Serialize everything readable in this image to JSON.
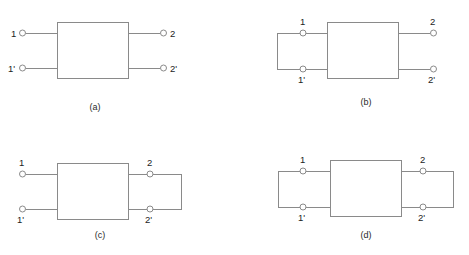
{
  "figure": {
    "type": "two-port-network-terminations",
    "panels": [
      {
        "id": "a",
        "caption": "(a)",
        "left_label_top": "1",
        "left_label_bottom": "1'",
        "right_label_top": "2",
        "right_label_bottom": "2'",
        "left_termination": "open",
        "right_termination": "open",
        "label_placement": "inline"
      },
      {
        "id": "b",
        "caption": "(b)",
        "left_label_top": "1",
        "left_label_bottom": "1'",
        "right_label_top": "2",
        "right_label_bottom": "2'",
        "left_termination": "short",
        "right_termination": "open",
        "label_placement": "stacked"
      },
      {
        "id": "c",
        "caption": "(c)",
        "left_label_top": "1",
        "left_label_bottom": "1'",
        "right_label_top": "2",
        "right_label_bottom": "2'",
        "left_termination": "open",
        "right_termination": "short",
        "label_placement": "stacked"
      },
      {
        "id": "d",
        "caption": "(d)",
        "left_label_top": "1",
        "left_label_bottom": "1'",
        "right_label_top": "2",
        "right_label_bottom": "2'",
        "left_termination": "short",
        "right_termination": "short",
        "label_placement": "stacked"
      }
    ],
    "colors": {
      "stroke": "#8a8a8a",
      "label_text": "#1d1d1d",
      "caption_text": "#2a2a2a",
      "background": "#ffffff"
    }
  }
}
